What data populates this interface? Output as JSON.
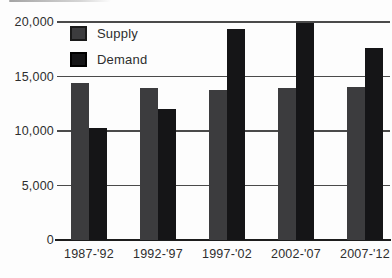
{
  "chart_data": {
    "type": "bar",
    "title": "",
    "xlabel": "",
    "ylabel": "",
    "categories": [
      "1987-'92",
      "1992-'97",
      "1997-'02",
      "2002-'07",
      "2007-'12"
    ],
    "series": [
      {
        "name": "Supply",
        "color": "#3c3c3e",
        "swatch_border": "#1a1a1a",
        "values": [
          14400,
          13900,
          13800,
          13900,
          14000
        ]
      },
      {
        "name": "Demand",
        "color": "#151517",
        "swatch_border": "#000000",
        "values": [
          10300,
          12000,
          19400,
          19900,
          17600
        ]
      }
    ],
    "ylim": [
      0,
      20000
    ],
    "yticks": [
      0,
      5000,
      10000,
      15000,
      20000
    ],
    "ytick_labels": [
      "0",
      "5,000",
      "10,000",
      "15,000",
      "20,000"
    ],
    "grid": true,
    "grid_color": "#4a4a4a",
    "axis_color": "#1d1d1d",
    "text_color": "#2e2e2e",
    "legend_position": "top-left-inside"
  }
}
